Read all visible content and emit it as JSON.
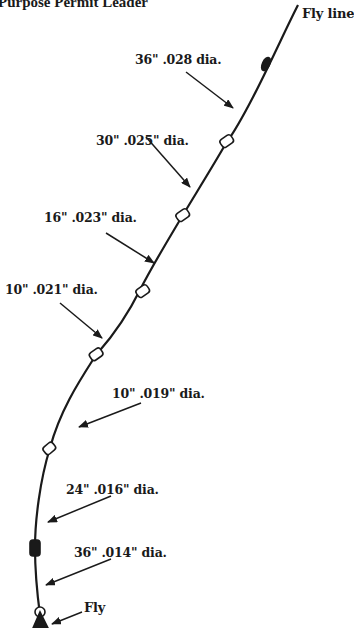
{
  "title": "Purpose Permit Leader",
  "fly_line_label": "Fly line",
  "fly_label": "Fly",
  "colors": {
    "ink": "#1a1a1a",
    "background": "#ffffff"
  },
  "sections": [
    {
      "length": "36\"",
      "diameter": ".028 dia.",
      "label": "36\"  .028 dia."
    },
    {
      "length": "30\"",
      "diameter": ".025\" dia.",
      "label": "30\"  .025\" dia."
    },
    {
      "length": "16\"",
      "diameter": ".023\" dia.",
      "label": "16\"  .023\" dia."
    },
    {
      "length": "10\"",
      "diameter": ".021\" dia.",
      "label": "10\"  .021\" dia."
    },
    {
      "length": "10\"",
      "diameter": ".019\" dia.",
      "label": "10\"  .019\" dia."
    },
    {
      "length": "24\"",
      "diameter": ".016\" dia.",
      "label": "24\"  .016\" dia."
    },
    {
      "length": "36\"",
      "diameter": ".014\" dia.",
      "label": "36\"  .014\" dia."
    }
  ]
}
